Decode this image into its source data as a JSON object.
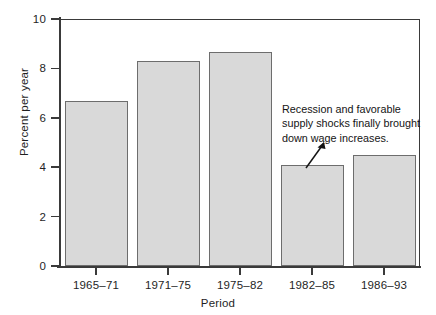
{
  "chart_data": {
    "type": "bar",
    "title": "",
    "subtitle": "",
    "xlabel": "Period",
    "ylabel": "Percent per year",
    "categories": [
      "1965–71",
      "1971–75",
      "1975–82",
      "1982–85",
      "1986–93"
    ],
    "values": [
      6.7,
      8.3,
      8.65,
      4.1,
      4.5
    ],
    "ylim": [
      0,
      10
    ],
    "yticks": [
      0,
      2,
      4,
      6,
      8,
      10
    ],
    "ytick_labels": [
      "0",
      "2",
      "4",
      "6",
      "8",
      "10"
    ],
    "grid": false,
    "legend": null,
    "annotations": [
      {
        "lines": [
          "Recession and favorable",
          "supply shocks finally brought",
          "down wage increases."
        ],
        "points_to": "1982–85"
      }
    ],
    "colors": {
      "bar_fill": "#d9d9d9",
      "bar_edge": "#6d6d6d",
      "axis": "#3a3a3a",
      "text": "#1f1f1f"
    }
  }
}
